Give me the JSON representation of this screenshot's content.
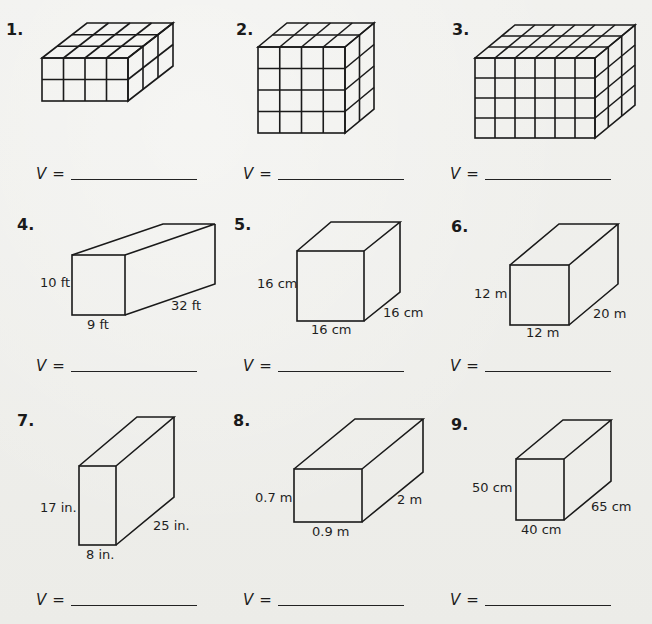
{
  "worksheet": {
    "answer_prefix": "V",
    "answer_equals": "=",
    "problems": [
      {
        "number": "1.",
        "type": "unit-cubes",
        "cubes": {
          "length": 4,
          "height": 2,
          "depth": 3
        },
        "answer": ""
      },
      {
        "number": "2.",
        "type": "unit-cubes",
        "cubes": {
          "length": 4,
          "height": 4,
          "depth": 2
        },
        "answer": ""
      },
      {
        "number": "3.",
        "type": "unit-cubes",
        "cubes": {
          "length": 6,
          "height": 4,
          "depth": 3
        },
        "answer": ""
      },
      {
        "number": "4.",
        "type": "prism",
        "height_label": "10 ft",
        "width_label": "9 ft",
        "depth_label": "32 ft",
        "answer": ""
      },
      {
        "number": "5.",
        "type": "prism",
        "height_label": "16 cm",
        "width_label": "16 cm",
        "depth_label": "16 cm",
        "answer": ""
      },
      {
        "number": "6.",
        "type": "prism",
        "height_label": "12 m",
        "width_label": "12 m",
        "depth_label": "20 m",
        "answer": ""
      },
      {
        "number": "7.",
        "type": "prism",
        "height_label": "17 in.",
        "width_label": "8 in.",
        "depth_label": "25 in.",
        "answer": ""
      },
      {
        "number": "8.",
        "type": "prism",
        "height_label": "0.7 m",
        "width_label": "0.9 m",
        "depth_label": "2 m",
        "answer": ""
      },
      {
        "number": "9.",
        "type": "prism",
        "height_label": "50 cm",
        "width_label": "40 cm",
        "depth_label": "65 cm",
        "answer": ""
      }
    ]
  }
}
